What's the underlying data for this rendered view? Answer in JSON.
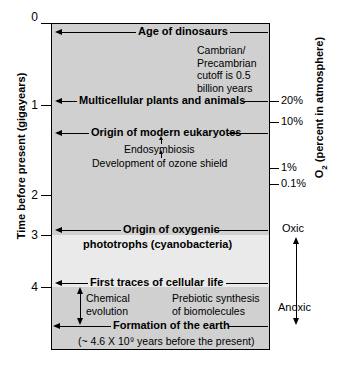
{
  "chart_data": {
    "type": "timeline",
    "y_axis": {
      "label": "Time before present (gigayears)",
      "ticks": [
        "0",
        "1",
        "2",
        "3",
        "4"
      ],
      "tick_values": [
        0,
        1,
        2,
        3,
        4
      ],
      "range": [
        0,
        4.6
      ],
      "direction": "top-is-present"
    },
    "right_axis": {
      "label": "O₂ (percent in atmosphere)",
      "ticks": [
        "20%",
        "10%",
        "1%",
        "0.1%"
      ],
      "tick_values": [
        20,
        10,
        1,
        0.1
      ],
      "redox_top": "Oxic",
      "redox_bottom": "Anoxic"
    },
    "events": [
      {
        "label": "Age of dinosaurs",
        "time_ga": 0.15
      },
      {
        "label": "Multicellular plants and animals",
        "time_ga": 0.9
      },
      {
        "label": "Origin of modern eukaryotes",
        "time_ga": 1.5
      },
      {
        "label": "Origin of oxygenic",
        "label2": "phototrophs (cyanobacteria)",
        "time_ga": 3.0
      },
      {
        "label": "First traces of cellular life",
        "time_ga": 4.0
      },
      {
        "label": "Formation of the earth",
        "time_ga": 4.6
      }
    ],
    "sub_events": [
      {
        "label": "Endosymbiosis",
        "time_ga": 1.75
      },
      {
        "label": "Development of ozone shield",
        "time_ga": 2.05
      }
    ],
    "annotations": [
      {
        "name": "cambrian-note",
        "lines": [
          "Cambrian/",
          "Precambrian",
          "cutoff is 0.5",
          "billion years"
        ]
      },
      {
        "name": "chemical-evolution",
        "lines": [
          "Chemical",
          "evolution"
        ]
      },
      {
        "name": "prebiotic-synthesis",
        "lines": [
          "Prebiotic synthesis",
          "of biomolecules"
        ]
      },
      {
        "name": "formation-subtitle",
        "text": "(~ 4.6 X 10⁹ years before the present)"
      }
    ],
    "bands": [
      {
        "name": "anoxic-upper-shade",
        "from_ga": 0.0,
        "to_ga": 3.0,
        "color": "#d0d0d0"
      },
      {
        "name": "transition-shade",
        "from_ga": 3.0,
        "to_ga": 4.0,
        "color": "#eaeaea"
      },
      {
        "name": "early-earth-shade",
        "from_ga": 4.0,
        "to_ga": 4.6,
        "color": "#d0d0d0"
      }
    ]
  },
  "axis": {
    "y_title": "Time before present (gigayears)",
    "y_tick_0": "0",
    "y_tick_1": "1",
    "y_tick_2": "2",
    "y_tick_3": "3",
    "y_tick_4": "4",
    "o2_title_pre": "O",
    "o2_title_sub": "2",
    "o2_title_post": " (percent in atmosphere)",
    "o2_20": "20%",
    "o2_10": "10%",
    "o2_1": "1%",
    "o2_01": "0.1%",
    "oxic": "Oxic",
    "anoxic": "Anoxic"
  },
  "events": {
    "dinosaurs": "Age of dinosaurs",
    "multicellular": "Multicellular plants and animals",
    "eukaryotes": "Origin of modern eukaryotes",
    "endosymbiosis": "Endosymbiosis",
    "ozone": "Development of ozone shield",
    "phototrophs_1": "Origin of oxygenic",
    "phototrophs_2": "phototrophs (cyanobacteria)",
    "cellular_life": "First traces of cellular life",
    "formation": "Formation of the earth",
    "formation_note": "(~ 4.6 X 10⁹ years before the present)"
  },
  "notes": {
    "cambrian_1": "Cambrian/",
    "cambrian_2": "Precambrian",
    "cambrian_3": "cutoff is 0.5",
    "cambrian_4": "billion years",
    "chemical_1": "Chemical",
    "chemical_2": "evolution",
    "prebiotic_1": "Prebiotic synthesis",
    "prebiotic_2": "of biomolecules"
  }
}
